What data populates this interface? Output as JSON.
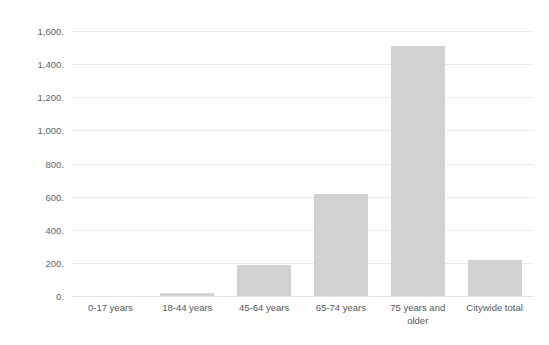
{
  "chart_data": {
    "type": "bar",
    "title": "",
    "subtitle": "",
    "xlabel": "",
    "ylabel": "",
    "categories": [
      "0-17 years",
      "18-44 years",
      "45-64 years",
      "65-74 years",
      "75 years and\nolder",
      "Citywide total"
    ],
    "values": [
      0,
      20,
      190,
      615,
      1510,
      215
    ],
    "ylim": [
      0,
      1600
    ],
    "ytick_values": [
      0,
      200,
      400,
      600,
      800,
      1000,
      1200,
      1400,
      1600
    ],
    "ytick_labels": [
      "0.",
      "200.",
      "400.",
      "600.",
      "800.",
      "1,000.",
      "1,200.",
      "1,400.",
      "1,600."
    ],
    "grid": true,
    "legend": false,
    "legend_position": "none",
    "bar_color": "#d2d2d2",
    "gridline_color": "#eceaea",
    "axis_text_color": "#636363",
    "background_color": "#ffffff"
  }
}
